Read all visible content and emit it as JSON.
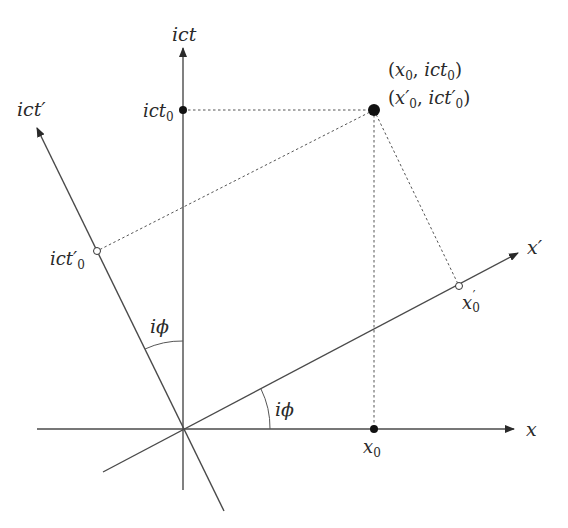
{
  "diagram": {
    "colors": {
      "axis": "#4a4a4a",
      "dashed": "#555555",
      "point": "#111111",
      "text": "#2a2a2a",
      "background": "#ffffff"
    },
    "axes": {
      "ict": {
        "label_main": "ict",
        "label_prime": ""
      },
      "ict_prime": {
        "label_main": "ict",
        "label_prime": "′"
      },
      "x": {
        "label_main": "x",
        "label_prime": ""
      },
      "x_prime": {
        "label_main": "x",
        "label_prime": "′"
      }
    },
    "points": {
      "event": {
        "line1": {
          "open": "(",
          "x": "x",
          "x_sub": "0",
          "sep": ", ",
          "t": "ict",
          "t_sub": "0",
          "close": ")"
        },
        "line2": {
          "open": "(",
          "x": "x′",
          "x_sub": "0",
          "sep": ", ",
          "t": "ict′",
          "t_sub": "0",
          "close": ")"
        }
      },
      "ict0": {
        "main": "ict",
        "sub": "0"
      },
      "x0": {
        "main": "x",
        "sub": "0"
      },
      "ict0_prime": {
        "main": "ict′",
        "sub": "0"
      },
      "x0_prime": {
        "main": "x",
        "sub": "0",
        "prime": "′"
      }
    },
    "angles": {
      "between_ict_axes": "iϕ",
      "between_x_axes": "iϕ"
    }
  }
}
